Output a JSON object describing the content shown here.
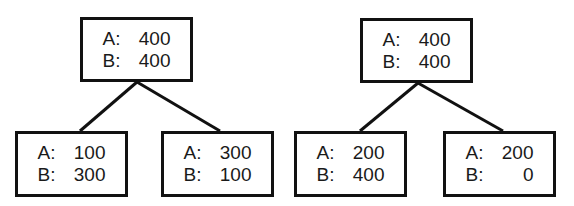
{
  "trees": [
    {
      "root": {
        "a_label": "A:",
        "a_value": "400",
        "b_label": "B:",
        "b_value": "400"
      },
      "left": {
        "a_label": "A:",
        "a_value": "100",
        "b_label": "B:",
        "b_value": "300"
      },
      "right": {
        "a_label": "A:",
        "a_value": "300",
        "b_label": "B:",
        "b_value": "100"
      }
    },
    {
      "root": {
        "a_label": "A:",
        "a_value": "400",
        "b_label": "B:",
        "b_value": "400"
      },
      "left": {
        "a_label": "A:",
        "a_value": "200",
        "b_label": "B:",
        "b_value": "400"
      },
      "right": {
        "a_label": "A:",
        "a_value": "200",
        "b_label": "B:",
        "b_value": "0"
      }
    }
  ]
}
